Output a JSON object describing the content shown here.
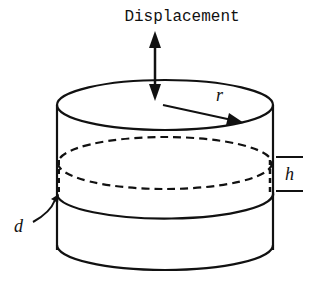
{
  "diagram": {
    "title_label": "Displacement",
    "labels": {
      "radius": "r",
      "height": "h",
      "diameter_or_depth": "d"
    },
    "colors": {
      "stroke": "#111111",
      "background": "#ffffff"
    },
    "elements": [
      "displacement-arrow (bidirectional vertical)",
      "cylinder-top-ellipse",
      "cylinder-walls",
      "dashed-inner-ellipse",
      "middle-band-line",
      "cylinder-bottom-edge",
      "radius-arrow",
      "height-bracket",
      "d-pointer-arrow"
    ]
  }
}
